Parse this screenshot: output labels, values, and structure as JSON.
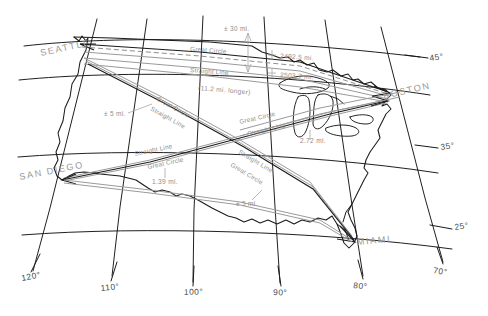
{
  "figure": {
    "kind": "map-diagram",
    "background_color": "#ffffff",
    "ink_color": "#1a1a1a",
    "annotation_color": "#8e8e8e"
  },
  "cities": [
    {
      "name": "SEATTLE",
      "x": 68,
      "y": 53
    },
    {
      "name": "BOSTON",
      "x": 390,
      "y": 93
    },
    {
      "name": "SAN DIEGO",
      "x": 27,
      "y": 176
    },
    {
      "name": "MIAMI",
      "x": 355,
      "y": 243
    }
  ],
  "graticule": {
    "longitude_labels": [
      {
        "value": "120°",
        "x": 26,
        "y": 277
      },
      {
        "value": "110°",
        "x": 106,
        "y": 288
      },
      {
        "value": "100°",
        "x": 190,
        "y": 292
      },
      {
        "value": "90°",
        "x": 276,
        "y": 292
      },
      {
        "value": "80°",
        "x": 357,
        "y": 285
      },
      {
        "value": "70°",
        "x": 437,
        "y": 270
      }
    ],
    "latitude_labels": [
      {
        "value": "45°",
        "x": 432,
        "y": 60
      },
      {
        "value": "35°",
        "x": 443,
        "y": 148
      },
      {
        "value": "25°",
        "x": 458,
        "y": 228
      }
    ]
  },
  "routes": [
    {
      "id": "seattle-boston",
      "from": "SEATTLE",
      "to": "BOSTON",
      "great_circle_label": "Great Circle",
      "great_circle_distance": "2492.5 mi.",
      "straight_line_label": "Straight Line",
      "straight_line_distance": "2503.7 mi.",
      "difference_note": "(11.2 mi. longer)",
      "separation_label": "± 30 mi."
    },
    {
      "id": "seattle-miami",
      "from": "SEATTLE",
      "to": "MIAMI",
      "great_circle_label": "Great Circle",
      "straight_line_label": "Straight Line",
      "separation_label": "± 5 mi."
    },
    {
      "id": "sandiego-boston",
      "from": "SAN DIEGO",
      "to": "BOSTON",
      "great_circle_label": "Great Circle",
      "straight_line_label": "Straight Line",
      "separation_label": "1.39 mi."
    },
    {
      "id": "sandiego-miami",
      "from": "SAN DIEGO",
      "to": "MIAMI",
      "great_circle_label": "Great Circle",
      "straight_line_label": "Straight Line",
      "separation_label": "± 5 mi."
    },
    {
      "id": "crossing-measure",
      "separation_label": "2.72 mi."
    },
    {
      "id": "northwest-measure",
      "separation_label": "± 5 mi."
    }
  ],
  "annotations": {
    "tol_30mi": "± 30 mi.",
    "tol_5mi_nw": "± 5 mi.",
    "tol_5mi_s": "± 5 mi.",
    "dist_gc_sea_bos": "2492.5 mi.",
    "dist_sl_sea_bos": "2503.7 mi.",
    "note_longer": "(11.2 mi. longer)",
    "dist_272": "2.72 mi.",
    "dist_139": "1.39 mi.",
    "great_circle": "Great Circle",
    "straight_line": "Straight Line"
  }
}
